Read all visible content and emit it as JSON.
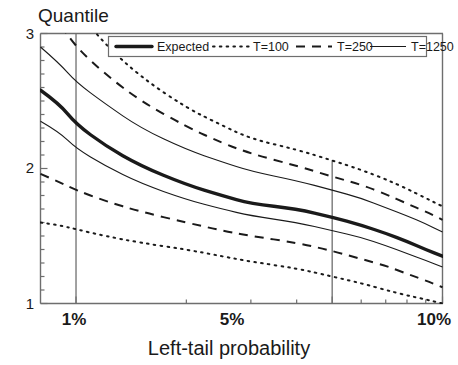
{
  "chart_data": {
    "type": "line",
    "title": "",
    "xlabel": "Left-tail probability",
    "ylabel": "Quantile",
    "xscale": "log",
    "xlim": [
      0.008,
      0.1
    ],
    "ylim": [
      1,
      3
    ],
    "grid": false,
    "legend_position": "top",
    "xticks": [
      0.01,
      0.05,
      0.1
    ],
    "xtick_labels": [
      "1%",
      "5%",
      "10%"
    ],
    "yticks": [
      1,
      2,
      3
    ],
    "ytick_labels": [
      "1",
      "2",
      "3"
    ],
    "y_minor_ticks": [
      1.1,
      1.2,
      1.3,
      1.4,
      1.5,
      1.6,
      1.7,
      1.8,
      1.9,
      2.1,
      2.2,
      2.3,
      2.4,
      2.5,
      2.6,
      2.7,
      2.8,
      2.9
    ],
    "x_minor_ticks": [
      0.02,
      0.03,
      0.04,
      0.06,
      0.07,
      0.08,
      0.09
    ],
    "reference_lines": [
      {
        "x": 0.01,
        "label": "1%"
      },
      {
        "x": 0.05,
        "label": "5%"
      }
    ],
    "x": [
      0.008,
      0.009,
      0.01,
      0.012,
      0.015,
      0.02,
      0.025,
      0.03,
      0.04,
      0.05,
      0.06,
      0.07,
      0.08,
      0.09,
      0.1
    ],
    "series": [
      {
        "name": "Expected",
        "style": "solid-thick",
        "band": "center",
        "values": [
          2.58,
          2.48,
          2.33,
          2.17,
          2.02,
          1.88,
          1.8,
          1.74,
          1.7,
          1.64,
          1.58,
          1.52,
          1.46,
          1.4,
          1.35
        ]
      },
      {
        "name": "T=100",
        "style": "dotted",
        "band": "upper",
        "values": [
          3.62,
          3.4,
          3.18,
          2.92,
          2.68,
          2.45,
          2.32,
          2.22,
          2.14,
          2.06,
          1.99,
          1.92,
          1.85,
          1.78,
          1.72
        ]
      },
      {
        "name": "T=100",
        "style": "dotted",
        "band": "lower",
        "values": [
          1.6,
          1.58,
          1.55,
          1.5,
          1.45,
          1.4,
          1.35,
          1.31,
          1.26,
          1.2,
          1.15,
          1.1,
          1.06,
          1.03,
          1.0
        ]
      },
      {
        "name": "T=250",
        "style": "dashed",
        "band": "upper",
        "values": [
          3.24,
          3.08,
          2.9,
          2.7,
          2.5,
          2.31,
          2.19,
          2.11,
          2.02,
          1.94,
          1.88,
          1.81,
          1.74,
          1.68,
          1.62
        ]
      },
      {
        "name": "T=250",
        "style": "dashed",
        "band": "lower",
        "values": [
          1.96,
          1.9,
          1.84,
          1.76,
          1.68,
          1.6,
          1.54,
          1.5,
          1.45,
          1.39,
          1.33,
          1.28,
          1.22,
          1.17,
          1.12
        ]
      },
      {
        "name": "T=1250",
        "style": "solid-thin",
        "band": "upper",
        "values": [
          2.9,
          2.78,
          2.64,
          2.48,
          2.3,
          2.14,
          2.05,
          1.98,
          1.91,
          1.84,
          1.78,
          1.71,
          1.65,
          1.59,
          1.53
        ]
      },
      {
        "name": "T=1250",
        "style": "solid-thin",
        "band": "lower",
        "values": [
          2.35,
          2.27,
          2.15,
          2.02,
          1.89,
          1.77,
          1.7,
          1.65,
          1.6,
          1.54,
          1.49,
          1.43,
          1.37,
          1.32,
          1.27
        ]
      }
    ]
  },
  "legend": {
    "entries": [
      {
        "label": "Expected",
        "style": "solid-thick"
      },
      {
        "label": "T=100",
        "style": "dotted"
      },
      {
        "label": "T=250",
        "style": "dashed"
      },
      {
        "label": "T=1250",
        "style": "solid-thin"
      }
    ]
  },
  "axes": {
    "y_axis_title": "Quantile",
    "x_axis_title": "Left-tail probability",
    "y_tick_top": "3",
    "y_tick_mid": "2",
    "y_tick_bottom": "1",
    "x_tick_1": "1%",
    "x_tick_2": "5%",
    "x_tick_3": "10%"
  },
  "colors": {
    "line": "#1a1a1a",
    "axis": "#6e6e6e",
    "background": "#ffffff"
  }
}
